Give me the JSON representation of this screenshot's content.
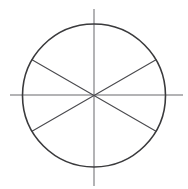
{
  "figure": {
    "type": "geometric-diagram",
    "canvas": {
      "width": 188,
      "height": 189,
      "background": "#ffffff"
    },
    "center": {
      "x": 94,
      "y": 95
    },
    "circle": {
      "label": "circle-outline",
      "cx": 94,
      "cy": 95.5,
      "r": 71.5,
      "stroke": "#3a3a3c",
      "stroke_width": 1.6,
      "fill": "none",
      "left_edge_x": 22.5,
      "right_edge_x": 165.5,
      "top_edge_y": 24,
      "bottom_edge_y": 167
    },
    "axes": [
      {
        "label": "horizontal-axis",
        "orientation": "horizontal",
        "stroke": "#9a9a9c",
        "stroke_width": 1.5,
        "x1": 10,
        "y1": 95,
        "x2": 183,
        "y2": 95,
        "extends_beyond_circle": true
      },
      {
        "label": "vertical-axis",
        "orientation": "vertical",
        "stroke": "#9a9a9c",
        "stroke_width": 1.5,
        "x1": 94,
        "y1": 9,
        "x2": 94,
        "y2": 186,
        "extends_beyond_circle": true
      }
    ],
    "diameters": [
      {
        "label": "diagonal-upper-left-to-lower-right",
        "angle_degrees": 30,
        "stroke": "#4a4a4e",
        "stroke_width": 1.1,
        "x1": 32.0,
        "y1": 59.8,
        "x2": 156.0,
        "y2": 131.2
      },
      {
        "label": "diagonal-lower-left-to-upper-right",
        "angle_degrees": -30,
        "stroke": "#4a4a4e",
        "stroke_width": 1.1,
        "x1": 32.0,
        "y1": 131.2,
        "x2": 156.0,
        "y2": 59.8
      }
    ],
    "sector_count": 6,
    "sector_angle_degrees": 60
  }
}
